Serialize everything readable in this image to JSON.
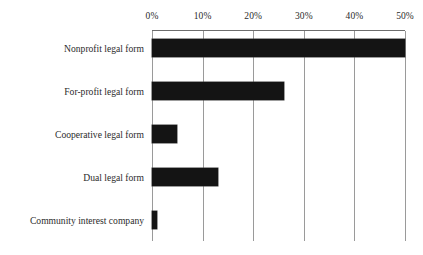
{
  "chart_data": {
    "type": "bar",
    "orientation": "horizontal",
    "title": "",
    "subtitle": "",
    "xlabel": "",
    "ylabel": "",
    "categories": [
      "Nonprofit legal form",
      "For-profit legal form",
      "Cooperative legal form",
      "Dual legal form",
      "Community interest company"
    ],
    "values": [
      50,
      26,
      5,
      13,
      1
    ],
    "value_unit": "%",
    "xlim": [
      0,
      50
    ],
    "ylim": null,
    "x_tick_labels": [
      "0%",
      "10%",
      "20%",
      "30%",
      "40%",
      "50%"
    ],
    "x_tick_values": [
      0,
      10,
      20,
      30,
      40,
      50
    ],
    "grid": true,
    "grid_axis": "x",
    "legend": false,
    "legend_position": "none",
    "annotations": [],
    "colors": {
      "bar": "#141414",
      "gridline": "#9a9a9a",
      "axis": "#6d6d6d",
      "text": "#2b2b2b",
      "background": "#ffffff"
    }
  }
}
